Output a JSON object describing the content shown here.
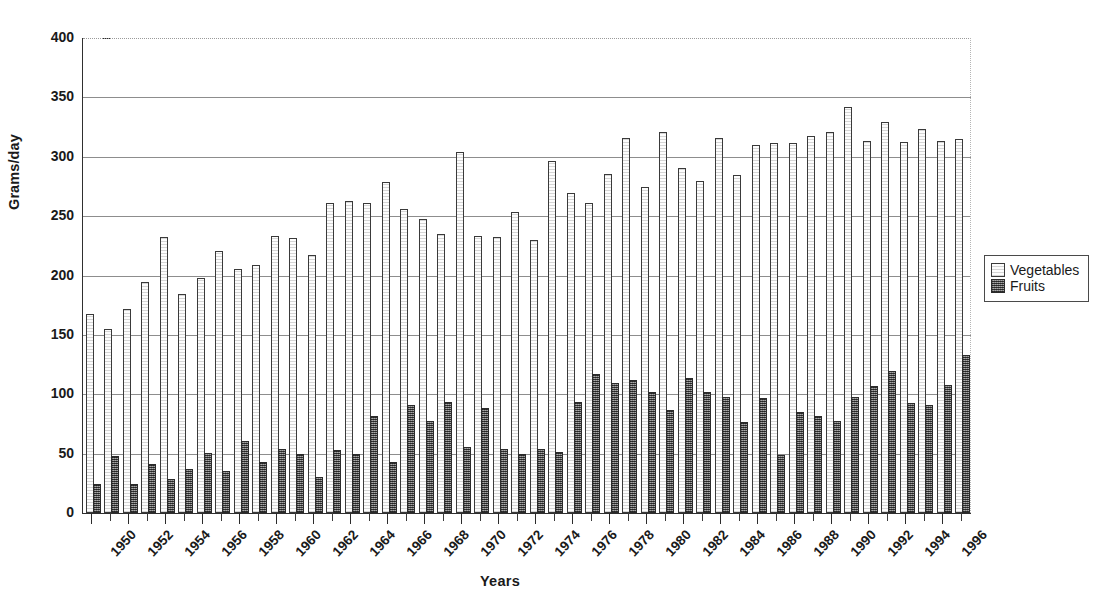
{
  "chart_data": {
    "type": "bar",
    "title": "",
    "xlabel": "Years",
    "ylabel": "Grams/day",
    "ylim": [
      0,
      400
    ],
    "ytick_values": [
      0,
      50,
      100,
      150,
      200,
      250,
      300,
      350,
      400
    ],
    "ytick_labels": [
      "0",
      "50",
      "100",
      "150",
      "200",
      "250",
      "300",
      "350",
      "400"
    ],
    "grid": "horizontal",
    "legend_position": "right",
    "categories": [
      "1950",
      "1951",
      "1952",
      "1953",
      "1954",
      "1955",
      "1956",
      "1957",
      "1958",
      "1959",
      "1960",
      "1961",
      "1962",
      "1963",
      "1964",
      "1965",
      "1966",
      "1967",
      "1968",
      "1969",
      "1970",
      "1971",
      "1972",
      "1973",
      "1974",
      "1975",
      "1976",
      "1977",
      "1978",
      "1979",
      "1980",
      "1981",
      "1982",
      "1983",
      "1984",
      "1985",
      "1986",
      "1987",
      "1988",
      "1989",
      "1990",
      "1991",
      "1992",
      "1993",
      "1994",
      "1995",
      "1996",
      "1997"
    ],
    "xtick_labels": [
      "1950",
      "1952",
      "1954",
      "1956",
      "1958",
      "1960",
      "1962",
      "1964",
      "1966",
      "1968",
      "1970",
      "1972",
      "1974",
      "1976",
      "1978",
      "1980",
      "1982",
      "1984",
      "1986",
      "1988",
      "1990",
      "1992",
      "1994",
      "1996"
    ],
    "series": [
      {
        "name": "Vegetables",
        "color": "#fdfdfd",
        "values": [
          166,
          153,
          170,
          193,
          231,
          183,
          196,
          219,
          204,
          207,
          232,
          230,
          216,
          259,
          261,
          259,
          277,
          254,
          246,
          233,
          302,
          232,
          231,
          252,
          228,
          295,
          268,
          259,
          284,
          314,
          273,
          319,
          289,
          278,
          314,
          283,
          308,
          310,
          310,
          316,
          319,
          340,
          312,
          328,
          311,
          322,
          312,
          313
        ]
      },
      {
        "name": "Fruits",
        "color": "#6d6d6d",
        "values": [
          23,
          46,
          23,
          40,
          27,
          35,
          49,
          34,
          59,
          41,
          52,
          48,
          29,
          51,
          48,
          80,
          41,
          89,
          76,
          92,
          54,
          87,
          52,
          48,
          52,
          50,
          92,
          115,
          108,
          110,
          100,
          85,
          112,
          100,
          96,
          75,
          95,
          47,
          83,
          80,
          76,
          96,
          105,
          118,
          91,
          89,
          106,
          131
        ]
      }
    ]
  },
  "legend": {
    "items": [
      {
        "label": "Vegetables",
        "swatch": "vegetables-swatch"
      },
      {
        "label": "Fruits",
        "swatch": "fruits-swatch"
      }
    ]
  }
}
